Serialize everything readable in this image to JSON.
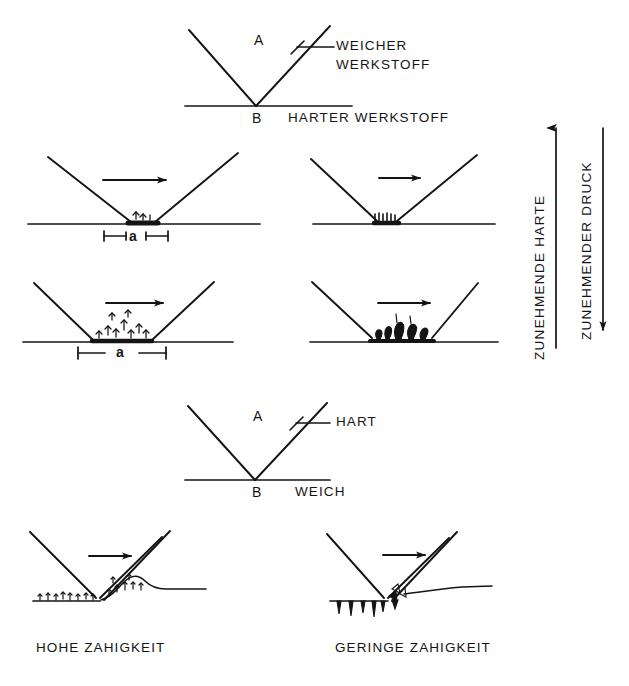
{
  "figure": {
    "title_visible": false,
    "language": "de",
    "background_color": "#ffffff",
    "ink_color": "#141414",
    "width": 629,
    "height": 686
  },
  "section_top": {
    "tool_label": "A",
    "tool_material_line1": "WEICHER",
    "tool_material_line2": "WERKSTOFF",
    "base_label": "B",
    "base_material": "HARTER WERKSTOFF"
  },
  "section_bottom": {
    "tool_label": "A",
    "tool_material": "HART",
    "base_label": "B",
    "base_material": "WEICH"
  },
  "axes": {
    "left_axis_label": "ZUNEHMENDE HARTE",
    "left_axis_arrow": "up",
    "right_axis_label": "ZUNEHMENDER DRUCK",
    "right_axis_arrow": "down"
  },
  "dimension_labels": {
    "small_contact": "a",
    "large_contact": "a"
  },
  "captions": {
    "bottom_left": "HOHE ZAHIGKEIT",
    "bottom_right": "GERINGE ZAHIGKEIT"
  },
  "panels": [
    {
      "id": "panel-top-left-small",
      "row": 1,
      "column": "left",
      "sliding_arrow": "right",
      "contact_width_label": "a",
      "wear_debris": "few-fine-particles",
      "description": "schmale Kontaktflaeche mit wenig Abrieb"
    },
    {
      "id": "panel-top-right-small",
      "row": 1,
      "column": "right",
      "sliding_arrow": "right",
      "contact_width_label": "",
      "wear_debris": "fine-serrated-layer",
      "description": "schmale Kontaktflaeche, feiner Abrieb"
    },
    {
      "id": "panel-bottom-left-large",
      "row": 2,
      "column": "left",
      "sliding_arrow": "right",
      "contact_width_label": "a",
      "wear_debris": "many-fine-particles",
      "description": "breite Kontaktflaeche mit viel feinem Abrieb"
    },
    {
      "id": "panel-bottom-right-large",
      "row": 2,
      "column": "right",
      "sliding_arrow": "right",
      "contact_width_label": "",
      "wear_debris": "large-blob-particles",
      "description": "breite Kontaktflaeche mit groben Verschleisspartikeln"
    },
    {
      "id": "panel-tough-material",
      "row": 3,
      "column": "left",
      "sliding_arrow": "right",
      "caption": "HOHE ZAHIGKEIT",
      "wear_mechanism": "ploughing-wave",
      "description": "Furchung mit aufgeworfenem Wall"
    },
    {
      "id": "panel-brittle-material",
      "row": 3,
      "column": "right",
      "sliding_arrow": "right",
      "caption": "GERINGE ZAHIGKEIT",
      "wear_mechanism": "chipping-spalling",
      "description": "Abplatzungen und Ausbrueche"
    }
  ]
}
